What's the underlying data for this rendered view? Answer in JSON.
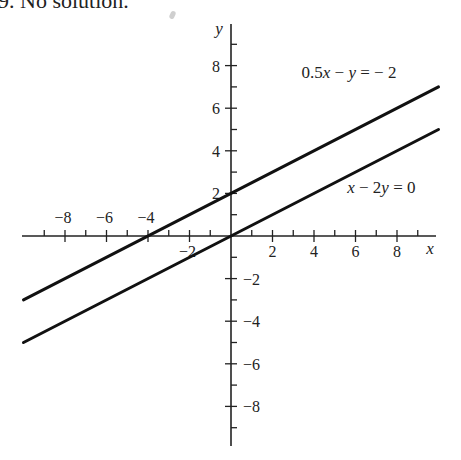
{
  "caption": "9. No solution.",
  "chart_data": {
    "type": "line",
    "title": "",
    "xlabel": "x",
    "ylabel": "y",
    "xlim": [
      -10,
      10
    ],
    "ylim": [
      -10,
      10
    ],
    "grid": false,
    "x_ticks": [
      -9,
      -8,
      -7,
      -6,
      -5,
      -4,
      -3,
      -2,
      -1,
      1,
      2,
      3,
      4,
      5,
      6,
      7,
      8,
      9
    ],
    "y_ticks": [
      -9,
      -8,
      -7,
      -6,
      -5,
      -4,
      -3,
      -2,
      -1,
      1,
      2,
      3,
      4,
      5,
      6,
      7,
      8,
      9
    ],
    "x_tick_labels": [
      {
        "value": -8,
        "text": "−8",
        "side": "above"
      },
      {
        "value": -6,
        "text": "−6",
        "side": "above"
      },
      {
        "value": -4,
        "text": "−4",
        "side": "above"
      },
      {
        "value": -2,
        "text": "−2",
        "side": "below"
      },
      {
        "value": 2,
        "text": "2",
        "side": "below"
      },
      {
        "value": 4,
        "text": "4",
        "side": "below"
      },
      {
        "value": 6,
        "text": "6",
        "side": "below"
      },
      {
        "value": 8,
        "text": "8",
        "side": "below"
      }
    ],
    "y_tick_labels": [
      {
        "value": 8,
        "text": "8",
        "side": "left"
      },
      {
        "value": 6,
        "text": "6",
        "side": "left"
      },
      {
        "value": 4,
        "text": "4",
        "side": "left"
      },
      {
        "value": 2,
        "text": "2",
        "side": "left"
      },
      {
        "value": -2,
        "text": "−2",
        "side": "right"
      },
      {
        "value": -4,
        "text": "−4",
        "side": "right"
      },
      {
        "value": -6,
        "text": "−6",
        "side": "right"
      },
      {
        "value": -8,
        "text": "−8",
        "side": "right"
      }
    ],
    "series": [
      {
        "name": "0.5x − y = −2",
        "slope": 0.5,
        "intercept": 2,
        "x": [
          -10,
          10
        ],
        "y": [
          -3,
          7
        ],
        "label_text": "0.5x − y = − 2",
        "label_anchor": {
          "x": 3.4,
          "y": 7.4
        }
      },
      {
        "name": "x − 2y = 0",
        "slope": 0.5,
        "intercept": 0,
        "x": [
          -10,
          10
        ],
        "y": [
          -5,
          5
        ],
        "label_text": "x − 2y = 0",
        "label_anchor": {
          "x": 5.6,
          "y": 2.0
        }
      }
    ],
    "legend": "inline-labels-top-right"
  }
}
